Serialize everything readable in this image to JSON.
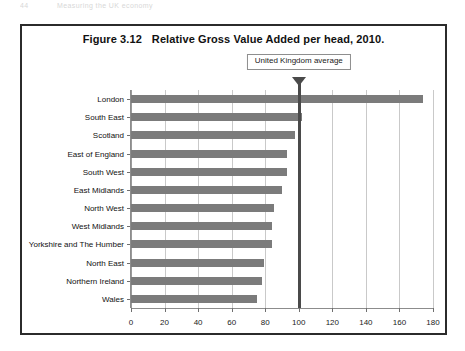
{
  "page_header": {
    "page_number": "44",
    "running_head": "Measuring the UK economy"
  },
  "figure": {
    "number": "Figure 3.12",
    "title": "Relative Gross Value Added per head, 2010."
  },
  "annotation": {
    "uk_average_label": "United Kingdom average",
    "uk_average_value": 100
  },
  "chart_data": {
    "type": "bar",
    "orientation": "horizontal",
    "xlabel": "",
    "ylabel": "",
    "xlim": [
      0,
      180
    ],
    "xticks": [
      0,
      20,
      40,
      60,
      80,
      100,
      120,
      140,
      160,
      180
    ],
    "xtick_labels": [
      "0",
      "20",
      "40",
      "60",
      "80",
      "100",
      "120",
      "140",
      "160",
      "180"
    ],
    "grid": true,
    "legend": false,
    "bar_color": "#7b7b7b",
    "reference_line": {
      "value": 100,
      "label": "United Kingdom average",
      "color": "#4a4a4a"
    },
    "categories": [
      "London",
      "South East",
      "Scotland",
      "East of England",
      "South West",
      "East Midlands",
      "North West",
      "West Midlands",
      "Yorkshire and The Humber",
      "North East",
      "Northern Ireland",
      "Wales"
    ],
    "values": [
      174,
      102,
      98,
      93,
      93,
      90,
      85,
      84,
      84,
      79,
      78,
      75
    ]
  }
}
